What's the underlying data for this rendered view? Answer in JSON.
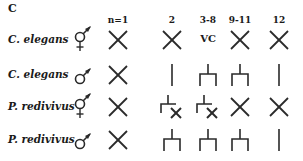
{
  "panel": {
    "label": "C"
  },
  "columns": [
    {
      "label": "n=1",
      "x": 118
    },
    {
      "label": "2",
      "x": 172
    },
    {
      "label": "3-8",
      "x": 208
    },
    {
      "label": "9-11",
      "x": 240
    },
    {
      "label": "12",
      "x": 279
    }
  ],
  "rows": [
    {
      "species": "C. elegans",
      "sex": "hermaphrodite",
      "sex_icon": "hermaphrodite-icon",
      "y": 40,
      "cells": [
        "cross",
        "cross",
        "VC",
        "cross",
        "cross"
      ]
    },
    {
      "species": "C. elegans",
      "sex": "male",
      "sex_icon": "male-icon",
      "y": 75,
      "cells": [
        "cross",
        "line",
        "fork",
        "fork",
        "line"
      ]
    },
    {
      "species": "P. redivivus",
      "sex": "hermaphrodite",
      "sex_icon": "hermaphrodite-icon",
      "y": 107,
      "cells": [
        "cross",
        "fork-cross",
        "fork-cross",
        "cross",
        "cross"
      ]
    },
    {
      "species": "P. redivivus",
      "sex": "male",
      "sex_icon": "male-icon",
      "y": 140,
      "cells": [
        "cross",
        "fork",
        "fork",
        "fork",
        "line"
      ]
    }
  ],
  "colors": {
    "stroke": "#2a2a2a",
    "text": "#1a1a1a",
    "background": "#ffffff"
  }
}
